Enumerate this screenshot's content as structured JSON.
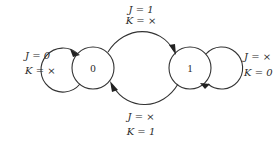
{
  "diagram": {
    "type": "state-diagram",
    "states": [
      {
        "id": "s0",
        "label": "0"
      },
      {
        "id": "s1",
        "label": "1"
      }
    ],
    "transitions": [
      {
        "id": "t00",
        "from": "0",
        "to": "0",
        "j": "J = 0",
        "k": "K = ×"
      },
      {
        "id": "t01",
        "from": "0",
        "to": "1",
        "j": "J = 1",
        "k": "K = ×"
      },
      {
        "id": "t10",
        "from": "1",
        "to": "0",
        "j": "J = ×",
        "k": "K = 1"
      },
      {
        "id": "t11",
        "from": "1",
        "to": "1",
        "j": "J = ×",
        "k": "K = 0"
      }
    ],
    "colors": {
      "stroke": "#333333",
      "text": "#2a2a2a",
      "background": "#ffffff"
    }
  }
}
